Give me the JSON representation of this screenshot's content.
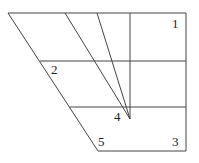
{
  "diagram": {
    "type": "geometric-figure",
    "labels": [
      {
        "id": "label-1",
        "text": "1",
        "x": 172,
        "y": 28
      },
      {
        "id": "label-2",
        "text": "2",
        "x": 51,
        "y": 74
      },
      {
        "id": "label-4",
        "text": "4",
        "x": 114,
        "y": 121
      },
      {
        "id": "label-5",
        "text": "5",
        "x": 98,
        "y": 146
      },
      {
        "id": "label-3",
        "text": "3",
        "x": 172,
        "y": 146
      }
    ],
    "stroke_color": "#444444"
  }
}
